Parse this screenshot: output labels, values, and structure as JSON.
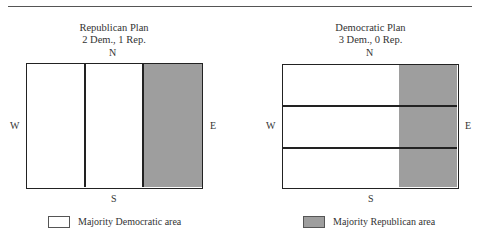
{
  "colors": {
    "democratic": "#ffffff",
    "republican": "#9e9e9e",
    "border": "#222222"
  },
  "left_plan": {
    "title": "Republican Plan",
    "subtitle": "2 Dem., 1 Rep.",
    "compass": {
      "n": "N",
      "s": "S",
      "w": "W",
      "e": "E"
    },
    "districts": [
      {
        "id": 1,
        "orientation": "vertical",
        "majority": "Democratic"
      },
      {
        "id": 2,
        "orientation": "vertical",
        "majority": "Democratic"
      },
      {
        "id": 3,
        "orientation": "vertical",
        "majority": "Republican"
      }
    ]
  },
  "right_plan": {
    "title": "Democratic Plan",
    "subtitle": "3 Dem., 0 Rep.",
    "compass": {
      "n": "N",
      "s": "S",
      "w": "W",
      "e": "E"
    },
    "districts": [
      {
        "id": 1,
        "orientation": "horizontal",
        "majority": "Democratic"
      },
      {
        "id": 2,
        "orientation": "horizontal",
        "majority": "Democratic"
      },
      {
        "id": 3,
        "orientation": "horizontal",
        "majority": "Democratic"
      }
    ],
    "republican_area": "eastern strip"
  },
  "legend": {
    "democratic_label": "Majority Democratic area",
    "republican_label": "Majority Republican area"
  }
}
